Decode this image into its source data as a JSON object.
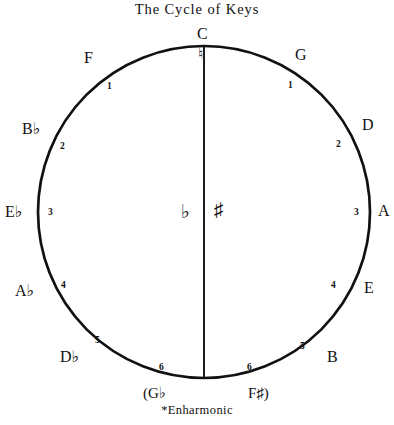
{
  "title": "The Cycle of Keys",
  "footnote": "*Enharmonic",
  "center": {
    "flat_symbol": "♭",
    "sharp_symbol": "♯",
    "divider": "vertical-line"
  },
  "top_marker": "♮",
  "keys": [
    {
      "id": "c",
      "label": "C",
      "accidental": "",
      "count": "",
      "position": "top"
    },
    {
      "id": "g",
      "label": "G",
      "accidental": "",
      "count": "1",
      "position": "upper-right"
    },
    {
      "id": "d",
      "label": "D",
      "accidental": "",
      "count": "2",
      "position": "right-upper"
    },
    {
      "id": "a",
      "label": "A",
      "accidental": "",
      "count": "3",
      "position": "right"
    },
    {
      "id": "e",
      "label": "E",
      "accidental": "",
      "count": "4",
      "position": "right-lower"
    },
    {
      "id": "b",
      "label": "B",
      "accidental": "",
      "count": "5",
      "position": "lower-right"
    },
    {
      "id": "fs",
      "label": "F♯)",
      "accidental": "♯",
      "count": "6",
      "position": "bottom-right"
    },
    {
      "id": "gb",
      "label": "(G♭",
      "accidental": "♭",
      "count": "6",
      "position": "bottom-left"
    },
    {
      "id": "db",
      "label": "D♭",
      "accidental": "♭",
      "count": "5",
      "position": "lower-left"
    },
    {
      "id": "ab",
      "label": "A♭",
      "accidental": "♭",
      "count": "4",
      "position": "left-lower"
    },
    {
      "id": "eb",
      "label": "E♭",
      "accidental": "♭",
      "count": "3",
      "position": "left"
    },
    {
      "id": "bb",
      "label": "B♭",
      "accidental": "♭",
      "count": "2",
      "position": "left-upper"
    },
    {
      "id": "f",
      "label": "F",
      "accidental": "",
      "count": "1",
      "position": "upper-left"
    }
  ],
  "colors": {
    "stroke": "#111111",
    "background": "#ffffff",
    "text": "#111111"
  },
  "geometry": {
    "center_x": 204,
    "center_y": 212,
    "radius": 166,
    "stroke_width": 2.6
  }
}
